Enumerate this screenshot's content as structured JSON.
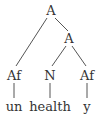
{
  "tree": {
    "root": {
      "label": "A"
    },
    "inner": {
      "label": "A"
    },
    "prefix_node": {
      "label": "Af"
    },
    "noun_node": {
      "label": "N"
    },
    "suffix_node": {
      "label": "Af"
    },
    "words": {
      "prefix": "un",
      "stem": "health",
      "suffix": "y"
    }
  },
  "colors": {
    "line": "#555555",
    "text": "#333333"
  }
}
